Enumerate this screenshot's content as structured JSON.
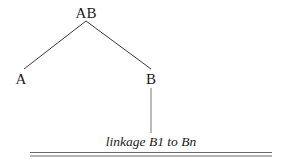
{
  "diagram": {
    "type": "tree",
    "nodes": [
      {
        "id": "AB",
        "label": "AB",
        "x": 86,
        "y": 18
      },
      {
        "id": "A",
        "label": "A",
        "x": 21,
        "y": 84
      },
      {
        "id": "B",
        "label": "B",
        "x": 151,
        "y": 84
      }
    ],
    "edges": [
      {
        "from": "AB",
        "to": "A"
      },
      {
        "from": "AB",
        "to": "B"
      }
    ],
    "connector": {
      "from": "B",
      "to": "caption"
    },
    "caption": "linkage B1 to Bn",
    "colors": {
      "text": "#1a1a1a",
      "lines": "#3a3a3a",
      "rule": "#6a6a6a"
    }
  }
}
